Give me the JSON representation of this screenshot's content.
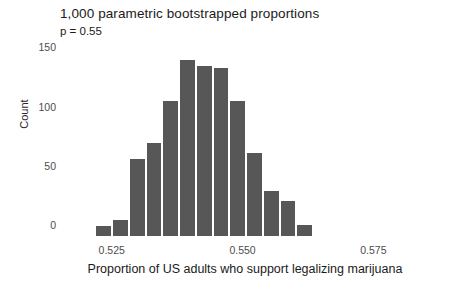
{
  "chart_data": {
    "type": "bar",
    "title": "1,000 parametric bootstrapped proportions",
    "subtitle": "p = 0.55",
    "xlabel": "Proportion of US adults who support legalizing marijuana",
    "ylabel": "Count",
    "grid": false,
    "legend": "none",
    "bar_color": "#575757",
    "bin_width": 0.0032,
    "xlim": [
      0.5155,
      0.5885
    ],
    "ylim": [
      0,
      158
    ],
    "xticks": [
      0.525,
      0.55,
      0.575,
      0.6
    ],
    "xtick_labels": [
      "0.525",
      "0.550",
      "0.575",
      "0.600"
    ],
    "yticks": [
      0,
      50,
      100,
      150
    ],
    "ytick_labels": [
      "0",
      "50",
      "100",
      "150"
    ],
    "bins": [
      {
        "center": 0.5171,
        "left": 0.5155,
        "right": 0.5187,
        "count": 2
      },
      {
        "center": 0.5203,
        "left": 0.5187,
        "right": 0.5219,
        "count": 0
      },
      {
        "center": 0.5235,
        "left": 0.5219,
        "right": 0.5251,
        "count": 10
      },
      {
        "center": 0.5267,
        "left": 0.5251,
        "right": 0.5283,
        "count": 15
      },
      {
        "center": 0.5299,
        "left": 0.5283,
        "right": 0.5315,
        "count": 67
      },
      {
        "center": 0.5331,
        "left": 0.5315,
        "right": 0.5347,
        "count": 80
      },
      {
        "center": 0.5363,
        "left": 0.5347,
        "right": 0.5379,
        "count": 116
      },
      {
        "center": 0.5395,
        "left": 0.5379,
        "right": 0.5411,
        "count": 150
      },
      {
        "center": 0.5427,
        "left": 0.5411,
        "right": 0.5443,
        "count": 145
      },
      {
        "center": 0.5459,
        "left": 0.5443,
        "right": 0.5475,
        "count": 144
      },
      {
        "center": 0.5491,
        "left": 0.5475,
        "right": 0.5507,
        "count": 116
      },
      {
        "center": 0.5523,
        "left": 0.5507,
        "right": 0.5539,
        "count": 72
      },
      {
        "center": 0.5555,
        "left": 0.5539,
        "right": 0.5571,
        "count": 40
      },
      {
        "center": 0.5587,
        "left": 0.5571,
        "right": 0.5603,
        "count": 31
      },
      {
        "center": 0.5619,
        "left": 0.5603,
        "right": 0.5635,
        "count": 11
      },
      {
        "center": 0.5651,
        "left": 0.5635,
        "right": 0.5667,
        "count": 2
      }
    ],
    "categories": [
      "0.5171",
      "0.5203",
      "0.5235",
      "0.5267",
      "0.5299",
      "0.5331",
      "0.5363",
      "0.5395",
      "0.5427",
      "0.5459",
      "0.5491",
      "0.5523",
      "0.5555",
      "0.5587",
      "0.5619",
      "0.5651"
    ],
    "values": [
      2,
      0,
      10,
      15,
      67,
      80,
      116,
      150,
      145,
      144,
      116,
      72,
      40,
      31,
      11,
      2
    ]
  }
}
